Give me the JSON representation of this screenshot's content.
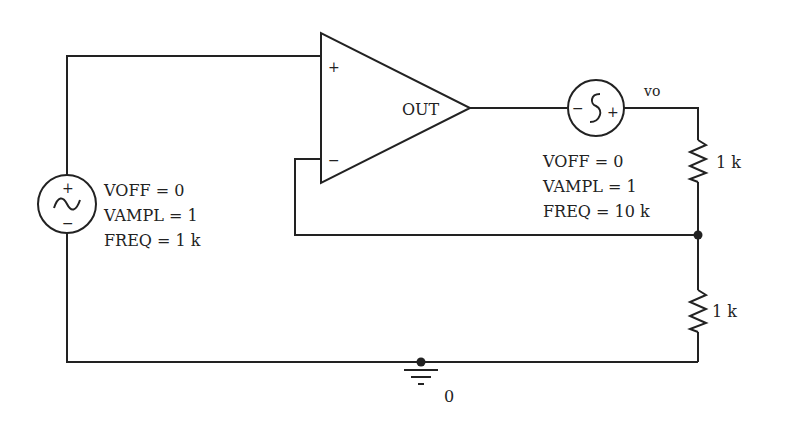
{
  "diagram": {
    "type": "circuit-schematic",
    "opamp": {
      "plus_label": "+",
      "minus_label": "−",
      "out_label": "OUT"
    },
    "input_source": {
      "plus_label": "+",
      "minus_label": "−",
      "params": [
        "VOFF = 0",
        "VAMPL = 1",
        "FREQ = 1 k"
      ]
    },
    "series_source": {
      "plus_label": "+",
      "minus_label": "−",
      "params": [
        "VOFF = 0",
        "VAMPL = 1",
        "FREQ = 10 k"
      ]
    },
    "output_node_label": "vo",
    "resistor_top": {
      "value": "1 k"
    },
    "resistor_bottom": {
      "value": "1 k"
    },
    "ground": {
      "node_label": "0"
    }
  }
}
